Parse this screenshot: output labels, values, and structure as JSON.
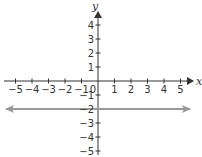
{
  "chart_data": {
    "type": "line",
    "title": "",
    "xlabel": "x",
    "ylabel": "y",
    "xlim": [
      -5,
      5
    ],
    "ylim": [
      -5,
      4
    ],
    "x_ticks": [
      -5,
      -4,
      -3,
      -2,
      -1,
      0,
      1,
      2,
      3,
      4,
      5
    ],
    "y_ticks": [
      4,
      3,
      2,
      1,
      -1,
      -2,
      -3,
      -4,
      -5
    ],
    "grid": false,
    "series": [
      {
        "name": "y = -2",
        "equation": "y = -2",
        "x": [
          -5.5,
          5.5
        ],
        "y": [
          -2,
          -2
        ],
        "color": "#999999",
        "arrows": "both"
      }
    ]
  },
  "labels": {
    "x_axis": "x",
    "y_axis": "y",
    "origin": "0",
    "x": [
      "−5",
      "−4",
      "−3",
      "−2",
      "−1",
      "1",
      "2",
      "3",
      "4",
      "5"
    ],
    "y": [
      "4",
      "3",
      "2",
      "1",
      "−1",
      "−2",
      "−3",
      "−4",
      "−5"
    ]
  },
  "colors": {
    "axis": "#333333",
    "line": "#999999"
  }
}
